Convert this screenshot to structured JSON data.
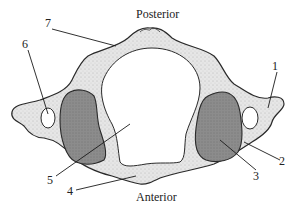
{
  "diagram": {
    "orientation": {
      "top": "Posterior",
      "bottom": "Anterior"
    },
    "labels": [
      {
        "id": "1",
        "text": "1",
        "x": 273,
        "y": 64
      },
      {
        "id": "2",
        "text": "2",
        "x": 279,
        "y": 159
      },
      {
        "id": "3",
        "text": "3",
        "x": 254,
        "y": 172
      },
      {
        "id": "4",
        "text": "4",
        "x": 66,
        "y": 186
      },
      {
        "id": "5",
        "text": "5",
        "x": 46,
        "y": 176
      },
      {
        "id": "6",
        "text": "6",
        "x": 22,
        "y": 40
      },
      {
        "id": "7",
        "text": "7",
        "x": 44,
        "y": 18
      }
    ],
    "colors": {
      "bone": "#e4e4e4",
      "bone_outline": "#2a2a2a",
      "facet": "#8a8a8a",
      "facet_dark": "#6e6e6e",
      "foramen": "#ffffff",
      "leader_line": "#1a1a1a"
    }
  }
}
